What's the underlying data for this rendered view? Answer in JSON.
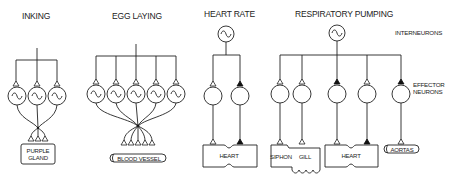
{
  "figure": {
    "panels": [
      {
        "id": "inking",
        "title": "INKING",
        "interneurons": 0,
        "effector_neurons": 3,
        "effector_type": "oscillator",
        "synapse_type": "excitatory",
        "target": "PURPLE GLAND",
        "target_lines": [
          "PURPLE",
          "GLAND"
        ]
      },
      {
        "id": "egg-laying",
        "title": "EGG LAYING",
        "interneurons": 0,
        "effector_neurons": 5,
        "effector_type": "oscillator",
        "synapse_type": "excitatory",
        "target": "BLOOD VESSEL"
      },
      {
        "id": "heart-rate",
        "title": "HEART RATE",
        "interneurons": 1,
        "effector_neurons": 2,
        "synapses": [
          "excitatory",
          "inhibitory"
        ],
        "target": "HEART"
      },
      {
        "id": "respiratory-pumping",
        "title": "RESPIRATORY PUMPING",
        "interneurons": 1,
        "effector_neurons": 5,
        "synapses": [
          "excitatory",
          "excitatory",
          "inhibitory",
          "excitatory",
          "inhibitory"
        ],
        "targets": [
          "SIPHON",
          "GILL",
          "HEART",
          "AORTAS"
        ]
      }
    ],
    "side_labels": {
      "interneurons": "INTERNEURONS",
      "effector_line1": "EFFECTOR",
      "effector_line2": "NEURONS"
    },
    "legend_semantics": {
      "open_triangle": "excitatory synapse",
      "filled_triangle": "inhibitory synapse",
      "sine_in_circle": "endogenous oscillator (burster)"
    },
    "colors": {
      "line": "#222222",
      "background": "#ffffff",
      "filled_synapse": "#111111"
    }
  }
}
